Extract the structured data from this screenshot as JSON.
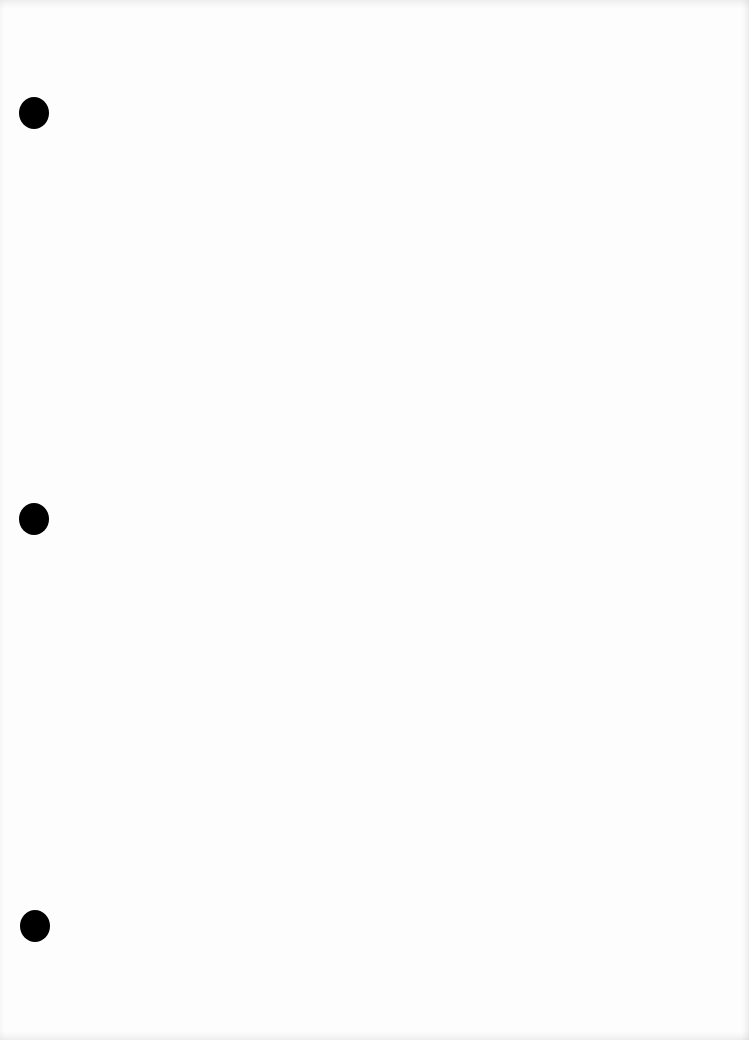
{
  "document": {
    "type": "blank scanned sheet",
    "text": "",
    "background_color": "#fdfdfd",
    "punch_holes": [
      {
        "cx": 34,
        "cy": 113,
        "color": "#000000"
      },
      {
        "cx": 34,
        "cy": 519,
        "color": "#000000"
      },
      {
        "cx": 35,
        "cy": 926,
        "color": "#000000"
      }
    ]
  }
}
